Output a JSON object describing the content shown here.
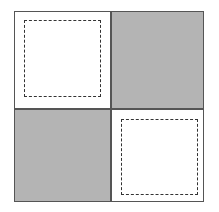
{
  "diagram": {
    "type": "checkerboard-2x2",
    "colors": {
      "border": "#555555",
      "shaded": "#bdbdbd",
      "plain": "#ffffff",
      "dashed": "#333333"
    },
    "cells": [
      {
        "position": "top-left",
        "fill": "plain",
        "dashed_inner_square": true
      },
      {
        "position": "top-right",
        "fill": "shaded",
        "dashed_inner_square": false
      },
      {
        "position": "bottom-left",
        "fill": "shaded",
        "dashed_inner_square": false
      },
      {
        "position": "bottom-right",
        "fill": "plain",
        "dashed_inner_square": true
      }
    ]
  }
}
